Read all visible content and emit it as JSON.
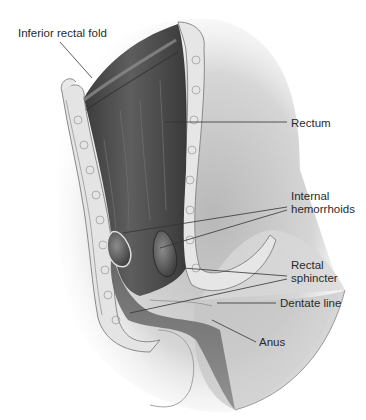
{
  "diagram": {
    "style": "grayscale medical illustration",
    "colors": {
      "background": "#ffffff",
      "lumen_dark": "#4a4a4a",
      "tissue_mid": "#9a9a9a",
      "fat_light": "#e6e6e6",
      "label_text": "#2a2a2a",
      "leader_line": "#333333"
    },
    "labels": [
      {
        "id": "inferior-rectal-fold",
        "lines": [
          "Inferior rectal fold"
        ],
        "points_to": [
          92,
          78
        ]
      },
      {
        "id": "rectum",
        "lines": [
          "Rectum"
        ],
        "points_to": [
          165,
          122
        ]
      },
      {
        "id": "internal-hemorrhoids",
        "lines": [
          "Internal",
          "hemorrhoids"
        ],
        "points_to": [
          [
            123,
            233
          ],
          [
            160,
            248
          ]
        ]
      },
      {
        "id": "rectal-sphincter",
        "lines": [
          "Rectal",
          "sphincter"
        ],
        "points_to": [
          [
            183,
            268
          ],
          [
            130,
            313
          ]
        ]
      },
      {
        "id": "dentate-line",
        "lines": [
          "Dentate line"
        ],
        "points_to": [
          217,
          303
        ]
      },
      {
        "id": "anus",
        "lines": [
          "Anus"
        ],
        "points_to": [
          212,
          320
        ]
      }
    ]
  }
}
